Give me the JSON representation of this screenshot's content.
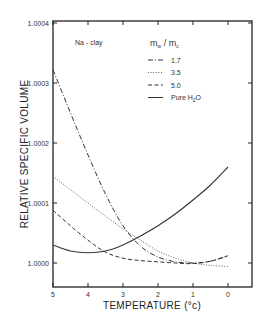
{
  "chart_data": {
    "type": "line",
    "title": "",
    "annotation": "Na - clay",
    "xlabel": "TEMPERATURE (°c)",
    "ylabel": "RELATIVE SPECIFIC VOLUME",
    "xlim": [
      5,
      0
    ],
    "ylim": [
      0.99996,
      1.0004
    ],
    "x_ticks": [
      5,
      4,
      3,
      2,
      1,
      0
    ],
    "y_ticks": [
      "1.0000",
      "1.0001",
      "1.0002",
      "1.0003",
      "1.0004"
    ],
    "grid": false,
    "legend": {
      "title_main": "m",
      "title_sub_w": "w",
      "title_slash": " / m",
      "title_sub_c": "c",
      "position": "upper right",
      "entries": [
        "1.7",
        "3.5",
        "5.0",
        "Pure H2O"
      ]
    },
    "x": [
      5.0,
      4.5,
      4.0,
      3.5,
      3.0,
      2.5,
      2.0,
      1.5,
      1.0,
      0.5,
      0.0
    ],
    "series": [
      {
        "name": "1.7",
        "style": "dash-dot",
        "values": [
          1.000322,
          1.00025,
          1.00018,
          1.000115,
          1.000062,
          1.000028,
          1.00001,
          1.000002,
          1.0,
          1.000003,
          1.000012
        ]
      },
      {
        "name": "3.5",
        "style": "dotted",
        "values": [
          1.000145,
          1.000122,
          1.0001,
          1.000078,
          1.000057,
          1.000038,
          1.00002,
          1.000008,
          1.0,
          0.999996,
          0.999994
        ]
      },
      {
        "name": "5.0",
        "style": "dashed",
        "values": [
          1.000088,
          1.000062,
          1.000038,
          1.000018,
          1.000008,
          1.000004,
          1.000002,
          1.0,
          0.999999,
          1.000003,
          1.000012
        ]
      },
      {
        "name": "Pure H2O",
        "style": "solid",
        "values": [
          1.00003,
          1.00002,
          1.000017,
          1.00002,
          1.00003,
          1.000045,
          1.000062,
          1.000082,
          1.000105,
          1.00013,
          1.00016
        ]
      }
    ]
  }
}
